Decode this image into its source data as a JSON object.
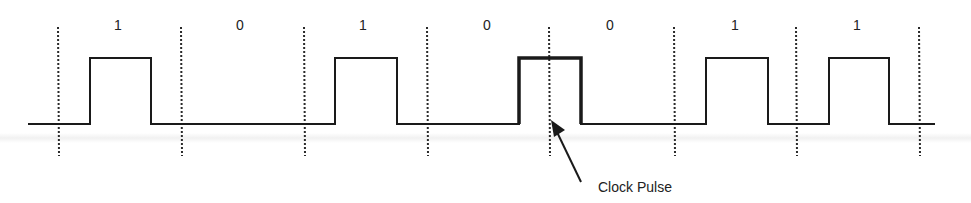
{
  "diagram": {
    "title": "",
    "bits": [
      "1",
      "0",
      "1",
      "0",
      "0",
      "1",
      "1"
    ],
    "bit_label_x": [
      118,
      240,
      363,
      487,
      610,
      735,
      857
    ],
    "clock_lines_x": [
      58,
      181,
      304,
      427,
      549,
      674,
      796,
      919
    ],
    "signal": {
      "baseline_y": 124,
      "high_y": 58,
      "start_x": 28,
      "end_x": 935,
      "pulses": [
        {
          "x0": 90,
          "x1": 151,
          "emphasized": false
        },
        {
          "x0": 335,
          "x1": 397,
          "emphasized": false
        },
        {
          "x0": 519,
          "x1": 581,
          "emphasized": true
        },
        {
          "x0": 706,
          "x1": 768,
          "emphasized": false
        },
        {
          "x0": 829,
          "x1": 889,
          "emphasized": false
        }
      ]
    },
    "annotation": {
      "label": "Clock Pulse",
      "arrow_from": [
        581,
        182
      ],
      "arrow_to": [
        551,
        120
      ]
    },
    "colors": {
      "stroke": "#1a1a1a",
      "dashed": "#2a2a2a"
    }
  }
}
